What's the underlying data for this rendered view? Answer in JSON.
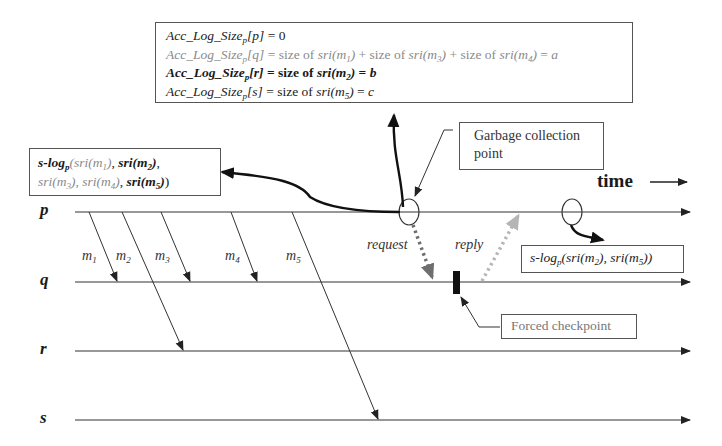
{
  "diagram": {
    "type": "space-time process diagram",
    "time_label": "time",
    "processes": [
      {
        "id": "p",
        "label": "p",
        "y": 212
      },
      {
        "id": "q",
        "label": "q",
        "y": 282
      },
      {
        "id": "r",
        "label": "r",
        "y": 351
      },
      {
        "id": "s",
        "label": "s",
        "y": 420
      }
    ],
    "messages": [
      {
        "label": "m",
        "sub": "1",
        "from": "p",
        "to": "q"
      },
      {
        "label": "m",
        "sub": "2",
        "from": "p",
        "to": "r"
      },
      {
        "label": "m",
        "sub": "3",
        "from": "p",
        "to": "q"
      },
      {
        "label": "m",
        "sub": "4",
        "from": "p",
        "to": "q"
      },
      {
        "label": "m",
        "sub": "5",
        "from": "p",
        "to": "s"
      }
    ],
    "events": {
      "request": "request",
      "reply": "reply"
    },
    "acc_box": {
      "lines": [
        {
          "lhs": "Acc_Log_Size",
          "sub": "p",
          "idx": "p",
          "rhs": "= 0"
        },
        {
          "lhs": "Acc_Log_Size",
          "sub": "p",
          "idx": "q",
          "rhs_parts": [
            "size of",
            "sri",
            "m",
            "1",
            "+ size of",
            "sri",
            "m",
            "3",
            "+ size of",
            "sri",
            "m",
            "4",
            "a"
          ]
        },
        {
          "lhs": "Acc_Log_Size",
          "sub": "p",
          "idx": "r",
          "rhs_parts": [
            "size of",
            "sri",
            "m",
            "2",
            "b"
          ]
        },
        {
          "lhs": "Acc_Log_Size",
          "sub": "p",
          "idx": "s",
          "rhs_parts": [
            "size of",
            "sri",
            "m",
            "5",
            "c"
          ]
        }
      ],
      "line_texts": [
        "Acc_Log_Size_p[p] = 0",
        "Acc_Log_Size_p[q] = size of sri(m_1) + size of sri(m_3) + size of sri(m_4) = a",
        "Acc_Log_Size_p[r] = size of sri(m_2) = b",
        "Acc_Log_Size_p[s] = size of sri(m_5) = c"
      ]
    },
    "slog_left": {
      "text": "s-log_p(sri(m_1), sri(m_2), sri(m_3), sri(m_4), sri(m_5))",
      "prefix": "s-log",
      "sub": "p"
    },
    "slog_right": {
      "text": "s-log_p(sri(m_2), sri(m_5))",
      "prefix": "s-log",
      "sub": "p"
    },
    "callouts": {
      "gc_line1": "Garbage collection",
      "gc_line2": "point",
      "forced_checkpoint": "Forced checkpoint"
    },
    "colors": {
      "line": "#333333",
      "request_arrow": "#6e6e6e",
      "reply_arrow": "#b5b5b5",
      "faded_text": "#8a8a8a",
      "checkpoint": "#111111"
    }
  }
}
